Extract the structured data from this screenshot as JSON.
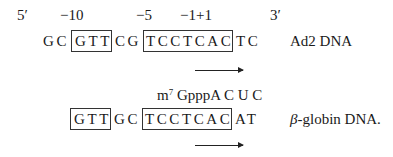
{
  "ad2": {
    "five_prime": "5′",
    "three_prime": "3′",
    "positions": [
      "−10",
      "−5",
      "−1+1"
    ],
    "prefix": "GC",
    "box1": "GTT",
    "middle": "CG",
    "box2": "TCCTCAC",
    "suffix": "TC",
    "label": "Ad2 DNA"
  },
  "globin": {
    "cap_m": "m",
    "cap_sup": "7",
    "cap_rest": " GpppA C U C",
    "box1": "GTT",
    "middle": "GC",
    "box2": "TCCTCAC",
    "suffix": "AT",
    "label_greek": "β",
    "label_rest": "-globin DNA."
  }
}
